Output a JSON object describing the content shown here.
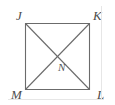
{
  "figure": {
    "type": "geometry-diagram",
    "background_color": "#ffffff",
    "stroke_color": "#6b6b6b",
    "label_color": "#4d4d4d",
    "stroke_width": 1.1,
    "square": {
      "name": "JKLM",
      "left": 25,
      "top": 23,
      "right": 90,
      "bottom": 90
    },
    "vertices": [
      {
        "id": "J",
        "label": "J",
        "position": "top-left",
        "x": 25,
        "y": 23
      },
      {
        "id": "K",
        "label": "K",
        "position": "top-right",
        "x": 90,
        "y": 23
      },
      {
        "id": "L",
        "label": "L",
        "position": "bottom-right",
        "x": 90,
        "y": 90
      },
      {
        "id": "M",
        "label": "M",
        "position": "bottom-left",
        "x": 25,
        "y": 90
      }
    ],
    "interior_points": [
      {
        "id": "N",
        "label": "N",
        "description": "intersection of diagonals",
        "x": 57.5,
        "y": 56.5
      }
    ],
    "sides": [
      {
        "id": "JK",
        "from": "J",
        "to": "K"
      },
      {
        "id": "KL",
        "from": "K",
        "to": "L"
      },
      {
        "id": "ML",
        "from": "M",
        "to": "L"
      },
      {
        "id": "JM",
        "from": "J",
        "to": "M"
      }
    ],
    "diagonals": [
      {
        "id": "JL",
        "from": "J",
        "to": "L"
      },
      {
        "id": "KM",
        "from": "K",
        "to": "M"
      }
    ]
  }
}
